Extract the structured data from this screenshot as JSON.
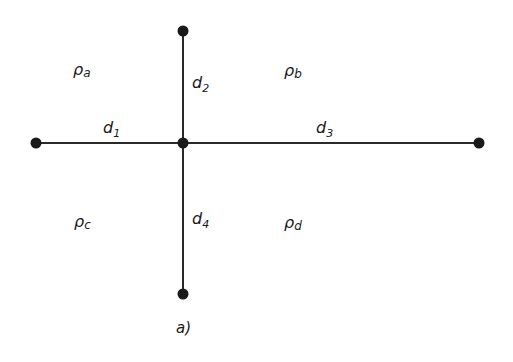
{
  "diagram": {
    "caption": "a)",
    "colors": {
      "line": "#2a2a2a",
      "node": "#1a1a1a",
      "background": "#ffffff"
    },
    "nodes": [
      {
        "id": "center",
        "x": 183,
        "y": 143
      },
      {
        "id": "top",
        "x": 183,
        "y": 31
      },
      {
        "id": "bottom",
        "x": 183,
        "y": 294
      },
      {
        "id": "left",
        "x": 36,
        "y": 143
      },
      {
        "id": "right",
        "x": 479,
        "y": 143
      }
    ],
    "edges": [
      {
        "from": "left",
        "to": "center",
        "label": "d",
        "sub": "1"
      },
      {
        "from": "center",
        "to": "top",
        "label": "d",
        "sub": "2"
      },
      {
        "from": "center",
        "to": "right",
        "label": "d",
        "sub": "3"
      },
      {
        "from": "center",
        "to": "bottom",
        "label": "d",
        "sub": "4"
      }
    ],
    "regions": [
      {
        "symbol": "ρ",
        "sub": "a"
      },
      {
        "symbol": "ρ",
        "sub": "b"
      },
      {
        "symbol": "ρ",
        "sub": "c"
      },
      {
        "symbol": "ρ",
        "sub": "d"
      }
    ]
  }
}
